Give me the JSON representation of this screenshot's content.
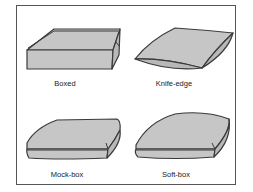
{
  "figure": {
    "colors": {
      "fill": "#c6c6c6",
      "fill_dark": "#b8b8b8",
      "stroke": "#3a3a3a",
      "frame": "#555555"
    },
    "panels": [
      {
        "id": "boxed",
        "label": "Boxed"
      },
      {
        "id": "knife-edge",
        "label": "Knife-edge"
      },
      {
        "id": "mock-box",
        "label": "Mock-box"
      },
      {
        "id": "soft-box",
        "label": "Soft-box"
      }
    ]
  }
}
